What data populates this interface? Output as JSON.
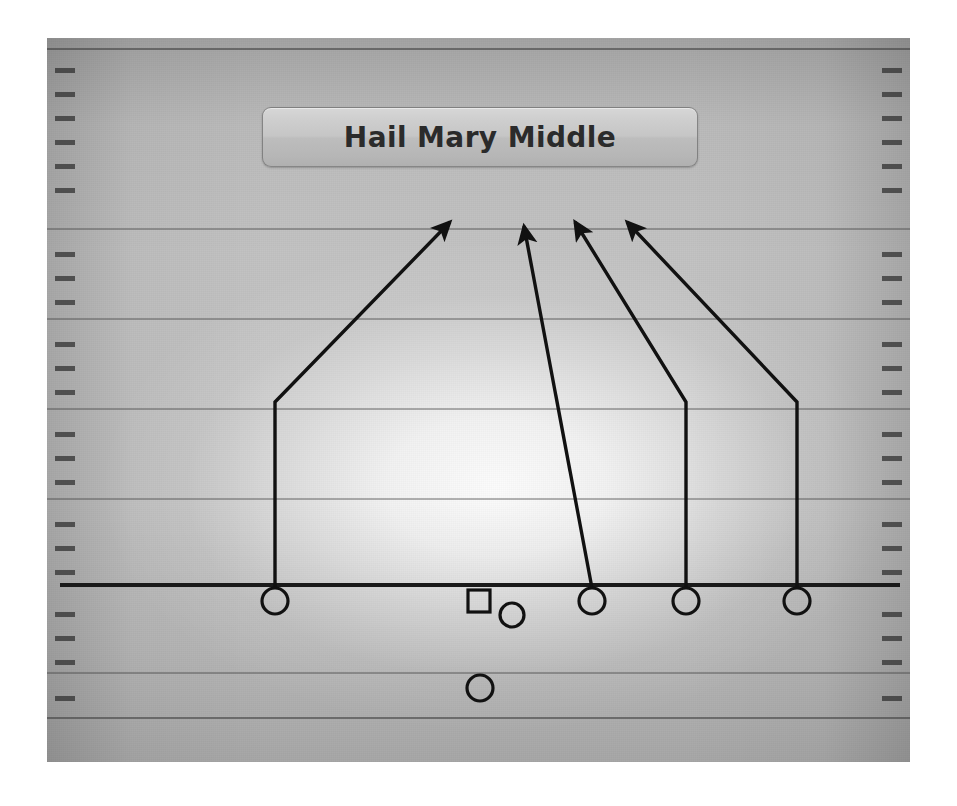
{
  "diagram": {
    "title": "Hail Mary Middle",
    "sport": "football",
    "type": "play-diagram",
    "colors": {
      "field": "#c2c2c2",
      "field_highlight": "#f5f5f5",
      "yard_line": "#3c3c3c",
      "hash_mark": "#2d2d2d",
      "scrimmage_line": "#1a1a1a",
      "route_line": "#111111",
      "player_outline": "#111111",
      "title_text": "#2b2b2b",
      "page_background": "#ffffff"
    },
    "field": {
      "x": 47,
      "y": 38,
      "width": 863,
      "height": 724
    },
    "title_plate": {
      "x": 262,
      "y": 107,
      "width": 434,
      "height": 58
    },
    "scrimmage_line": {
      "x1": 60,
      "x2": 900,
      "y": 583,
      "thickness": 4
    },
    "yard_lines": [
      {
        "y": 48,
        "edge": true
      },
      {
        "y": 228,
        "edge": false
      },
      {
        "y": 318,
        "edge": false
      },
      {
        "y": 408,
        "edge": false
      },
      {
        "y": 498,
        "edge": false
      },
      {
        "y": 672,
        "edge": false
      },
      {
        "y": 717,
        "edge": true
      }
    ],
    "hash_marks_y": [
      68,
      92,
      116,
      140,
      164,
      188,
      252,
      276,
      300,
      342,
      366,
      390,
      432,
      456,
      480,
      522,
      546,
      570,
      612,
      636,
      660,
      696
    ],
    "players": [
      {
        "id": "WR-left",
        "shape": "circle",
        "x": 275,
        "y": 601,
        "radius": 13,
        "on_line": true
      },
      {
        "id": "Center",
        "shape": "square",
        "x": 479,
        "y": 601,
        "size": 22,
        "on_line": true
      },
      {
        "id": "QB",
        "shape": "circle",
        "x": 512,
        "y": 615,
        "radius": 12,
        "on_line": false
      },
      {
        "id": "Slot",
        "shape": "circle",
        "x": 592,
        "y": 601,
        "radius": 13,
        "on_line": true
      },
      {
        "id": "WR-mid",
        "shape": "circle",
        "x": 686,
        "y": 601,
        "radius": 13,
        "on_line": true
      },
      {
        "id": "WR-right",
        "shape": "circle",
        "x": 797,
        "y": 601,
        "radius": 13,
        "on_line": true
      },
      {
        "id": "Back",
        "shape": "circle",
        "x": 480,
        "y": 688,
        "radius": 13,
        "on_line": false
      }
    ],
    "routes": [
      {
        "id": "route-wr-left",
        "from_player": "WR-left",
        "points": [
          [
            275,
            588
          ],
          [
            275,
            402
          ],
          [
            450,
            222
          ]
        ],
        "arrow": true,
        "description": "stem upfield then angle to the middle deep"
      },
      {
        "id": "route-slot",
        "from_player": "Slot",
        "points": [
          [
            592,
            588
          ],
          [
            524,
            226
          ]
        ],
        "arrow": true,
        "description": "straight seam to deep middle"
      },
      {
        "id": "route-wr-mid",
        "from_player": "WR-mid",
        "points": [
          [
            686,
            588
          ],
          [
            686,
            402
          ],
          [
            575,
            222
          ]
        ],
        "arrow": true,
        "description": "vertical stem then break to middle deep"
      },
      {
        "id": "route-wr-right",
        "from_player": "WR-right",
        "points": [
          [
            797,
            588
          ],
          [
            797,
            402
          ],
          [
            627,
            222
          ]
        ],
        "arrow": true,
        "description": "vertical stem then break to middle deep"
      }
    ]
  }
}
